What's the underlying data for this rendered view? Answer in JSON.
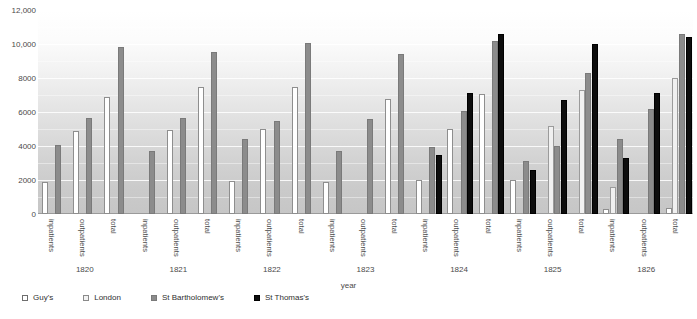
{
  "chart_data": {
    "type": "bar",
    "title": "",
    "xlabel": "year",
    "ylabel": "",
    "ylim": [
      0,
      12000
    ],
    "yticks": [
      0,
      2000,
      4000,
      6000,
      8000,
      10000,
      12000
    ],
    "ytick_labels": [
      "0",
      "2000",
      "4000",
      "6000",
      "8000",
      "10,000",
      "12,000"
    ],
    "grid": true,
    "legend_position": "bottom-left",
    "categories": [
      "inpatients",
      "outpatients",
      "total"
    ],
    "groups": [
      "1820",
      "1821",
      "1822",
      "1823",
      "1824",
      "1825",
      "1826"
    ],
    "series_names": [
      "Guy's",
      "London",
      "St Bartholomew's",
      "St Thomas's"
    ],
    "series_colors": [
      "#ffffff",
      "#f0f0f0",
      "#8c8c8c",
      "#0d0d0d"
    ],
    "data": [
      {
        "year": "1820",
        "categories": [
          {
            "name": "inpatients",
            "values": {
              "Guy's": 1900,
              "London": null,
              "St Bartholomew's": 4050,
              "St Thomas's": null
            }
          },
          {
            "name": "outpatients",
            "values": {
              "Guy's": 4900,
              "London": null,
              "St Bartholomew's": 5650,
              "St Thomas's": null
            }
          },
          {
            "name": "total",
            "values": {
              "Guy's": 6900,
              "London": null,
              "St Bartholomew's": 9800,
              "St Thomas's": null
            }
          }
        ]
      },
      {
        "year": "1821",
        "categories": [
          {
            "name": "inpatients",
            "values": {
              "Guy's": null,
              "London": null,
              "St Bartholomew's": 3700,
              "St Thomas's": null
            }
          },
          {
            "name": "outpatients",
            "values": {
              "Guy's": 4950,
              "London": null,
              "St Bartholomew's": 5650,
              "St Thomas's": null
            }
          },
          {
            "name": "total",
            "values": {
              "Guy's": 7500,
              "London": null,
              "St Bartholomew's": 9550,
              "St Thomas's": null
            }
          }
        ]
      },
      {
        "year": "1822",
        "categories": [
          {
            "name": "inpatients",
            "values": {
              "Guy's": 1950,
              "London": null,
              "St Bartholomew's": 4400,
              "St Thomas's": null
            }
          },
          {
            "name": "outpatients",
            "values": {
              "Guy's": 5000,
              "London": null,
              "St Bartholomew's": 5450,
              "St Thomas's": null
            }
          },
          {
            "name": "total",
            "values": {
              "Guy's": 7450,
              "London": null,
              "St Bartholomew's": 10050,
              "St Thomas's": null
            }
          }
        ]
      },
      {
        "year": "1823",
        "categories": [
          {
            "name": "inpatients",
            "values": {
              "Guy's": 1900,
              "London": null,
              "St Bartholomew's": 3700,
              "St Thomas's": null
            }
          },
          {
            "name": "outpatients",
            "values": {
              "Guy's": null,
              "London": null,
              "St Bartholomew's": 5600,
              "St Thomas's": null
            }
          },
          {
            "name": "total",
            "values": {
              "Guy's": 6750,
              "London": null,
              "St Bartholomew's": 9400,
              "St Thomas's": null
            }
          }
        ]
      },
      {
        "year": "1824",
        "categories": [
          {
            "name": "inpatients",
            "values": {
              "Guy's": 2000,
              "London": null,
              "St Bartholomew's": 3950,
              "St Thomas's": 3500
            }
          },
          {
            "name": "outpatients",
            "values": {
              "Guy's": 5000,
              "London": null,
              "St Bartholomew's": 6050,
              "St Thomas's": 7100
            }
          },
          {
            "name": "total",
            "values": {
              "Guy's": 7050,
              "London": null,
              "St Bartholomew's": 10150,
              "St Thomas's": 10600
            }
          }
        ]
      },
      {
        "year": "1825",
        "categories": [
          {
            "name": "inpatients",
            "values": {
              "Guy's": 2000,
              "London": null,
              "St Bartholomew's": 3100,
              "St Thomas's": 2600
            }
          },
          {
            "name": "outpatients",
            "values": {
              "Guy's": null,
              "London": 5200,
              "St Bartholomew's": 4000,
              "St Thomas's": 6700
            }
          },
          {
            "name": "total",
            "values": {
              "Guy's": null,
              "London": 7300,
              "St Bartholomew's": 8300,
              "St Thomas's": 10000
            }
          }
        ]
      },
      {
        "year": "1826",
        "categories": [
          {
            "name": "inpatients",
            "values": {
              "Guy's": 300,
              "London": 1600,
              "St Bartholomew's": 4400,
              "St Thomas's": 3300
            }
          },
          {
            "name": "outpatients",
            "values": {
              "Guy's": null,
              "London": null,
              "St Bartholomew's": 6200,
              "St Thomas's": 7100
            }
          },
          {
            "name": "total",
            "values": {
              "Guy's": 350,
              "London": 8000,
              "St Bartholomew's": 10600,
              "St Thomas's": 10400
            }
          }
        ]
      }
    ]
  },
  "legend": {
    "items": [
      {
        "label": "Guy's",
        "key": "guys"
      },
      {
        "label": "London",
        "key": "london"
      },
      {
        "label": "St Bartholomew's",
        "key": "stbart"
      },
      {
        "label": "St Thomas's",
        "key": "stthomas"
      }
    ]
  }
}
